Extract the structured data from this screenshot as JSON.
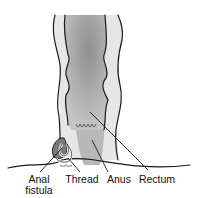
{
  "diagram": {
    "labels": [
      {
        "id": "anal_fistula",
        "line1": "Anal",
        "line2": "fistula"
      },
      {
        "id": "thread",
        "line1": "Thread"
      },
      {
        "id": "anus",
        "line1": "Anus"
      },
      {
        "id": "rectum",
        "line1": "Rectum"
      }
    ],
    "colors": {
      "outline": "#1a1a1a",
      "outer_wall": "#e4e4e4",
      "lumen": "#a8a8a8",
      "lumen_dark": "#8c8c8c",
      "thread": "#b0b0b0"
    }
  }
}
